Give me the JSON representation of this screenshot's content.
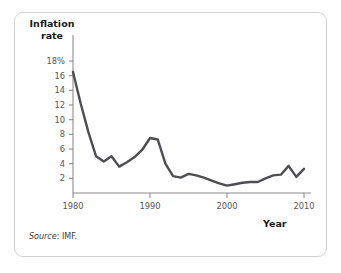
{
  "figure": {
    "source_note_prefix": "Source",
    "source_note_value": ": IMF.",
    "border_color": "#d3d3d3",
    "background": "#ffffff"
  },
  "chart_data": {
    "type": "line",
    "title": "",
    "subtitle": "",
    "xlabel": "Year",
    "ylabel": "Inflation rate",
    "ylabel_line1": "Inflation",
    "ylabel_line2": "rate",
    "line_color": "#4d4d52",
    "axis_color": "#8c8c8c",
    "grid": false,
    "legend": false,
    "legend_position": "none",
    "xlim": [
      1980,
      2010
    ],
    "ylim": [
      0,
      19
    ],
    "xticks": [
      1980,
      1990,
      2000,
      2010
    ],
    "xtick_labels": [
      "1980",
      "1990",
      "2000",
      "2010"
    ],
    "yticks": [
      2,
      4,
      6,
      8,
      10,
      12,
      14,
      16,
      18
    ],
    "ytick_labels": [
      "2",
      "4",
      "6",
      "8",
      "6",
      "10",
      "12",
      "14",
      "16",
      "18%"
    ],
    "y_axis_tick_labels": [
      "18%",
      "16",
      "14",
      "12",
      "10",
      "8",
      "6",
      "4",
      "2"
    ],
    "x": [
      1980,
      1981,
      1982,
      1983,
      1984,
      1985,
      1986,
      1987,
      1988,
      1989,
      1990,
      1991,
      1992,
      1993,
      1994,
      1995,
      1996,
      1997,
      1998,
      1999,
      2000,
      2001,
      2002,
      2003,
      2004,
      2005,
      2006,
      2007,
      2008,
      2009,
      2010
    ],
    "values": [
      16.5,
      12.2,
      8.3,
      5.0,
      4.3,
      5.0,
      3.6,
      4.2,
      4.9,
      5.9,
      7.5,
      7.3,
      4.0,
      2.3,
      2.1,
      2.6,
      2.4,
      2.1,
      1.7,
      1.3,
      1.0,
      1.2,
      1.4,
      1.5,
      1.5,
      2.0,
      2.4,
      2.5,
      3.7,
      2.2,
      3.3
    ],
    "series": [
      {
        "name": "Inflation rate",
        "values": [
          16.5,
          12.2,
          8.3,
          5.0,
          4.3,
          5.0,
          3.6,
          4.2,
          4.9,
          5.9,
          7.5,
          7.3,
          4.0,
          2.3,
          2.1,
          2.6,
          2.4,
          2.1,
          1.7,
          1.3,
          1.0,
          1.2,
          1.4,
          1.5,
          1.5,
          2.0,
          2.4,
          2.5,
          3.7,
          2.2,
          3.3
        ]
      }
    ]
  }
}
